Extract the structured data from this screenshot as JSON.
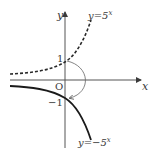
{
  "diagram": {
    "type": "function-graph",
    "axes": {
      "x_label": "x",
      "y_label": "y",
      "origin_label": "O"
    },
    "curves": [
      {
        "name": "y=5^x",
        "label_prefix": "y=5",
        "label_exp": "x",
        "style": "dashed",
        "y_intercept": "1"
      },
      {
        "name": "y=-5^x",
        "label_prefix": "y=−5",
        "label_exp": "x",
        "style": "solid",
        "y_intercept": "−1"
      }
    ],
    "annotation": "curved arrow indicating reflection across x-axis from (0,1) to (0,-1)"
  }
}
